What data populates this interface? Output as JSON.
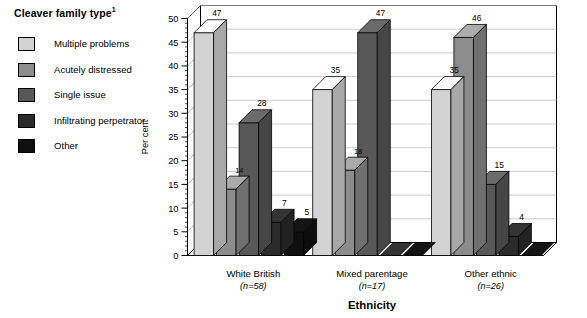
{
  "legend": {
    "title": "Cleaver family type",
    "title_superscript": "1",
    "items": [
      {
        "label": "Multiple problems",
        "color": "#d2d2d2"
      },
      {
        "label": "Acutely distressed",
        "color": "#8c8c8c"
      },
      {
        "label": "Single issue",
        "color": "#585858"
      },
      {
        "label": "Infiltrating perpetrator",
        "color": "#2b2b2b"
      },
      {
        "label": "Other",
        "color": "#101010"
      }
    ]
  },
  "chart_data": {
    "type": "bar",
    "title": "",
    "xlabel": "Ethnicity",
    "ylabel": "Per cent",
    "ylim": [
      0,
      50
    ],
    "ytick_step": 5,
    "yticks": [
      "0",
      "5",
      "10",
      "15",
      "20",
      "25",
      "30",
      "35",
      "40",
      "45",
      "50"
    ],
    "grid": true,
    "legend_position": "left",
    "style": "3d-column",
    "categories": [
      "White British",
      "Mixed parentage",
      "Other ethnic"
    ],
    "category_sublabels": [
      "(n=58)",
      "(n=17)",
      "(n=26)"
    ],
    "series": [
      {
        "name": "Multiple problems",
        "color": "#d2d2d2",
        "values": [
          47,
          35,
          35
        ]
      },
      {
        "name": "Acutely distressed",
        "color": "#8c8c8c",
        "values": [
          14,
          18,
          46
        ]
      },
      {
        "name": "Single issue",
        "color": "#585858",
        "values": [
          28,
          47,
          15
        ]
      },
      {
        "name": "Infiltrating perpetrator",
        "color": "#2b2b2b",
        "values": [
          7,
          0,
          4
        ]
      },
      {
        "name": "Other",
        "color": "#101010",
        "values": [
          5,
          0,
          0
        ]
      }
    ],
    "value_labels": [
      [
        "47",
        "14",
        "28",
        "7",
        "5"
      ],
      [
        "35",
        "18",
        "47",
        "",
        ""
      ],
      [
        "35",
        "46",
        "15",
        "4",
        ""
      ]
    ]
  }
}
